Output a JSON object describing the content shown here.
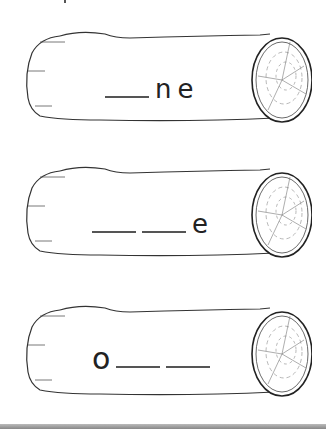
{
  "worksheet": {
    "logs": [
      {
        "parts": [
          {
            "type": "blank"
          },
          {
            "type": "letter",
            "text": "n"
          },
          {
            "type": "letter",
            "text": "e"
          }
        ],
        "answer_pattern": "_ne"
      },
      {
        "parts": [
          {
            "type": "blank"
          },
          {
            "type": "blank"
          },
          {
            "type": "letter",
            "text": "e"
          }
        ],
        "answer_pattern": "__e"
      },
      {
        "parts": [
          {
            "type": "letter",
            "text": "o"
          },
          {
            "type": "blank"
          },
          {
            "type": "blank"
          }
        ],
        "answer_pattern": "o__"
      }
    ],
    "log_1": {
      "letter_1": "n",
      "letter_2": "e"
    },
    "log_2": {
      "letter_1": "e"
    },
    "log_3": {
      "letter_1": "o"
    },
    "colors": {
      "line": "#222222",
      "paper": "#ffffff",
      "bottom_bar": "#999999"
    }
  }
}
